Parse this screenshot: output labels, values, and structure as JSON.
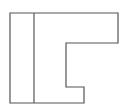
{
  "diagram": {
    "type": "outline-shape",
    "stroke_color": "#555555",
    "background": "#ffffff",
    "outline_points": "10,13 118,13 118,43 66,43 66,87 84,87 84,103 10,103",
    "divider": {
      "x1": 34,
      "y1": 13,
      "x2": 34,
      "y2": 103
    }
  }
}
